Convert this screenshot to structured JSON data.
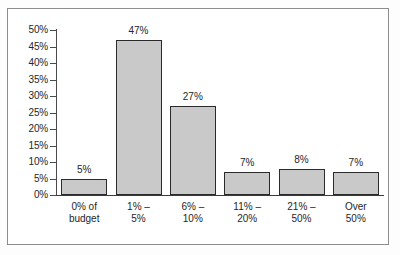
{
  "chart_data": {
    "type": "bar",
    "title": "",
    "subtitle": "",
    "xlabel": "",
    "ylabel": "",
    "categories": [
      "0% of budget",
      "1% – 5%",
      "6% – 10%",
      "11% – 20%",
      "21% – 50%",
      "Over 50%"
    ],
    "category_lines": [
      [
        "0% of",
        "budget"
      ],
      [
        "1% –",
        "5%"
      ],
      [
        "6% –",
        "10%"
      ],
      [
        "11% –",
        "20%"
      ],
      [
        "21% –",
        "50%"
      ],
      [
        "Over",
        "50%"
      ]
    ],
    "values": [
      5,
      47,
      27,
      7,
      8,
      7
    ],
    "value_labels": [
      "5%",
      "47%",
      "27%",
      "7%",
      "8%",
      "7%"
    ],
    "ylim": [
      0,
      50
    ],
    "ytick_values": [
      50,
      45,
      40,
      35,
      30,
      25,
      20,
      15,
      10,
      5,
      0
    ],
    "ytick_labels": [
      "50%",
      "45%",
      "40%",
      "35%",
      "30%",
      "25%",
      "20%",
      "15%",
      "10%",
      "5%",
      "0%"
    ],
    "grid": false,
    "legend": null,
    "legend_position": "none",
    "annotations": [],
    "colors": {
      "bar_fill": "#c9c9c9",
      "bar_border": "#2b2b2b",
      "axis": "#4a4a4a",
      "text": "#262626",
      "frame_border": "#8d8d8d",
      "background": "#ffffff"
    }
  }
}
